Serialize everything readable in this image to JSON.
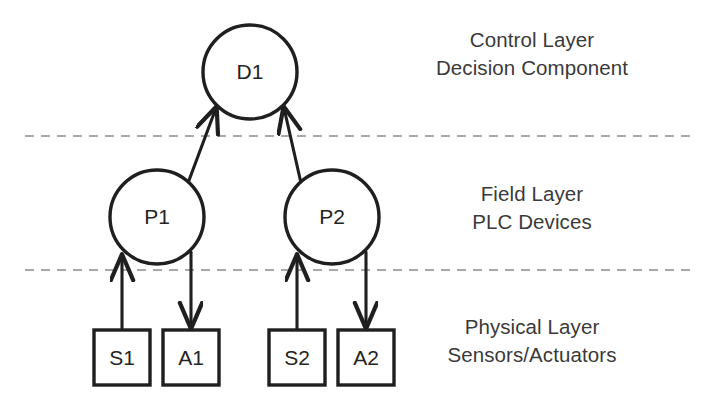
{
  "diagram": {
    "background_color": "#ffffff",
    "stroke_color": "#1f1f1f",
    "text_color": "#3a3a3a",
    "divider_color": "#a9a9a9"
  },
  "nodes": {
    "decision": {
      "label": "D1",
      "shape": "circle",
      "cx": 250,
      "cy": 72,
      "r": 47
    },
    "plc1": {
      "label": "P1",
      "shape": "circle",
      "cx": 157,
      "cy": 217,
      "r": 47
    },
    "plc2": {
      "label": "P2",
      "shape": "circle",
      "cx": 332,
      "cy": 217,
      "r": 47
    },
    "sensor1": {
      "label": "S1",
      "shape": "rect",
      "x": 94,
      "y": 330,
      "w": 56,
      "h": 55
    },
    "actuator1": {
      "label": "A1",
      "shape": "rect",
      "x": 163,
      "y": 330,
      "w": 56,
      "h": 55
    },
    "sensor2": {
      "label": "S2",
      "shape": "rect",
      "x": 269,
      "y": 330,
      "w": 56,
      "h": 55
    },
    "actuator2": {
      "label": "A2",
      "shape": "rect",
      "x": 338,
      "y": 330,
      "w": 56,
      "h": 55
    }
  },
  "edges": [
    {
      "name": "p1-to-d1",
      "from": "P1",
      "to": "D1",
      "direction": "up"
    },
    {
      "name": "p2-to-d1",
      "from": "P2",
      "to": "D1",
      "direction": "up"
    },
    {
      "name": "s1-to-p1",
      "from": "S1",
      "to": "P1",
      "direction": "up"
    },
    {
      "name": "p1-to-a1",
      "from": "P1",
      "to": "A1",
      "direction": "down"
    },
    {
      "name": "s2-to-p2",
      "from": "S2",
      "to": "P2",
      "direction": "up"
    },
    {
      "name": "p2-to-a2",
      "from": "P2",
      "to": "A2",
      "direction": "down"
    }
  ],
  "dividers": [
    {
      "name": "control-field-divider",
      "y": 136,
      "x1": 25,
      "x2": 690
    },
    {
      "name": "field-physical-divider",
      "y": 270,
      "x1": 25,
      "x2": 690
    }
  ],
  "layers": {
    "control": {
      "line1": "Control Layer",
      "line2": "Decision Component"
    },
    "field": {
      "line1": "Field Layer",
      "line2": "PLC Devices"
    },
    "physical": {
      "line1": "Physical Layer",
      "line2": "Sensors/Actuators"
    }
  }
}
